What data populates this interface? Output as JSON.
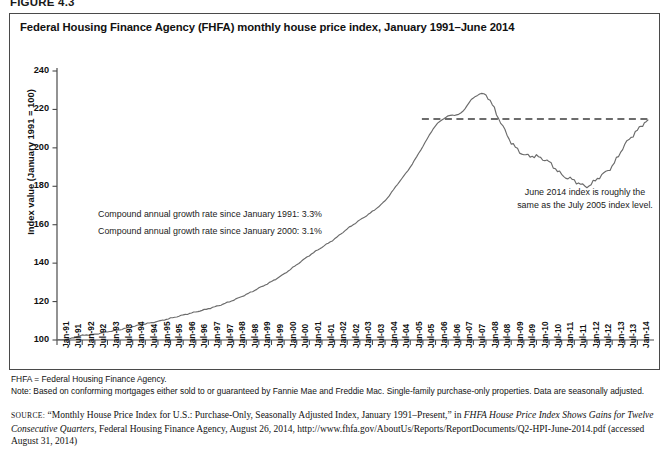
{
  "figure_label": "FIGURE 4.3",
  "chart_title": "Federal Housing Finance Agency (FHFA) monthly house price index, January 1991–June 2014",
  "annotations": {
    "growth_1991": "Compound annual growth rate since January 1991: 3.3%",
    "growth_2000": "Compound annual growth rate since January 2000: 3.1%",
    "right_line1": "June 2014 index is roughly the",
    "right_line2": "same as the July 2005 index level."
  },
  "notes": {
    "abbrev": "FHFA = Federal Housing Finance Agency.",
    "note": "Note: Based on conforming mortgages either sold to or guaranteed by Fannie Mae and Freddie Mac. Single-family purchase-only properties. Data are seasonally adjusted."
  },
  "source": {
    "kicker": "SOURCE:",
    "text_1": " “Monthly House Price Index for U.S.: Purchase-Only, Seasonally Adjusted Index, January 1991–Present,” in ",
    "italic_1": "FHFA House Price Index Shows Gains for Twelve Consecutive Quarters",
    "text_2": ", Federal Housing Finance Agency, August 26, 2014, http://www.fhfa.gov/AboutUs/Reports/ReportDocuments/Q2-HPI-June-2014.pdf (accessed August 31, 2014)"
  },
  "colors": {
    "line": "#6b6b6b",
    "axis": "#4a4a4a",
    "reference_line": "#3d3d3d",
    "border": "#4a4a4a"
  },
  "chart_data": {
    "type": "line",
    "title": "Federal Housing Finance Agency (FHFA) monthly house price index, January 1991–June 2014",
    "xlabel": "",
    "ylabel": "Index value (January 1991 = 100)",
    "ylim": [
      100,
      240
    ],
    "ytick_labels": [
      "100",
      "120",
      "140",
      "160",
      "180",
      "200",
      "220",
      "240"
    ],
    "yticks": [
      100,
      120,
      140,
      160,
      180,
      200,
      220,
      240
    ],
    "grid": false,
    "legend": "none",
    "xtick_labels": [
      "Jan-91",
      "Jul-91",
      "Jan-92",
      "Jul-92",
      "Jan-93",
      "Jul-93",
      "Jan-94",
      "Jul-94",
      "Jan-95",
      "Jul-95",
      "Jan-96",
      "Jul-96",
      "Jan-97",
      "Jul-97",
      "Jan-98",
      "Jul-98",
      "Jan-99",
      "Jul-99",
      "Jan-00",
      "Jul-00",
      "Jan-01",
      "Jul-01",
      "Jan-02",
      "Jul-02",
      "Jan-03",
      "Jul-03",
      "Jan-04",
      "Jul-04",
      "Jan-05",
      "Jul-05",
      "Jan-06",
      "Jul-06",
      "Jan-07",
      "Jul-07",
      "Jan-08",
      "Jul-08",
      "Jan-09",
      "Jul-09",
      "Jan-10",
      "Jul-10",
      "Jan-11",
      "Jul-11",
      "Jan-12",
      "Jul-12",
      "Jan-13",
      "Jul-13",
      "Jan-14"
    ],
    "reference_line": {
      "value": 215,
      "style": "dashed",
      "label": "July 2005 index level",
      "x_start": "Jul-05",
      "x_end": "Jun-14"
    },
    "series": [
      {
        "name": "FHFA monthly house price index",
        "x_start": "Jan-91",
        "x_end": "Jun-14",
        "frequency": "monthly",
        "points_semiannual": [
          {
            "x": "Jan-91",
            "y": 100.0
          },
          {
            "x": "Jul-91",
            "y": 100.6
          },
          {
            "x": "Jan-92",
            "y": 102.4
          },
          {
            "x": "Jul-92",
            "y": 103.0
          },
          {
            "x": "Jan-93",
            "y": 104.3
          },
          {
            "x": "Jul-93",
            "y": 105.4
          },
          {
            "x": "Jan-94",
            "y": 107.0
          },
          {
            "x": "Jul-94",
            "y": 108.4
          },
          {
            "x": "Jan-95",
            "y": 109.7
          },
          {
            "x": "Jul-95",
            "y": 111.3
          },
          {
            "x": "Jan-96",
            "y": 113.0
          },
          {
            "x": "Jul-96",
            "y": 114.6
          },
          {
            "x": "Jan-97",
            "y": 116.3
          },
          {
            "x": "Jul-97",
            "y": 118.3
          },
          {
            "x": "Jan-98",
            "y": 120.8
          },
          {
            "x": "Jul-98",
            "y": 123.7
          },
          {
            "x": "Jan-99",
            "y": 127.0
          },
          {
            "x": "Jul-99",
            "y": 130.4
          },
          {
            "x": "Jan-00",
            "y": 134.4
          },
          {
            "x": "Jul-00",
            "y": 139.2
          },
          {
            "x": "Jan-01",
            "y": 144.0
          },
          {
            "x": "Jul-01",
            "y": 148.3
          },
          {
            "x": "Jan-02",
            "y": 152.6
          },
          {
            "x": "Jul-02",
            "y": 157.8
          },
          {
            "x": "Jan-03",
            "y": 162.4
          },
          {
            "x": "Jul-03",
            "y": 166.9
          },
          {
            "x": "Jan-04",
            "y": 172.5
          },
          {
            "x": "Jul-04",
            "y": 181.2
          },
          {
            "x": "Jan-05",
            "y": 190.0
          },
          {
            "x": "Jul-05",
            "y": 200.8
          },
          {
            "x": "Jan-06",
            "y": 211.5
          },
          {
            "x": "Jul-06",
            "y": 216.5
          },
          {
            "x": "Jan-07",
            "y": 218.0
          },
          {
            "x": "Jul-07",
            "y": 226.0
          },
          {
            "x": "Jan-08",
            "y": 227.5
          },
          {
            "x": "Jul-08",
            "y": 215.5
          },
          {
            "x": "Jan-09",
            "y": 203.0
          },
          {
            "x": "Jul-09",
            "y": 196.5
          },
          {
            "x": "Jan-10",
            "y": 195.5
          },
          {
            "x": "Jul-10",
            "y": 192.5
          },
          {
            "x": "Jan-11",
            "y": 186.0
          },
          {
            "x": "Jul-11",
            "y": 183.0
          },
          {
            "x": "Jan-12",
            "y": 180.0
          },
          {
            "x": "Jul-12",
            "y": 185.0
          },
          {
            "x": "Jan-13",
            "y": 190.5
          },
          {
            "x": "Jul-13",
            "y": 201.5
          },
          {
            "x": "Jan-14",
            "y": 209.0
          },
          {
            "x": "Jun-14",
            "y": 214.5
          }
        ],
        "start_value": 100,
        "peak_value": 228,
        "peak_date": "Apr-07",
        "trough_value": 180,
        "trough_date": "Mar-12",
        "end_value": 214.5
      }
    ]
  }
}
